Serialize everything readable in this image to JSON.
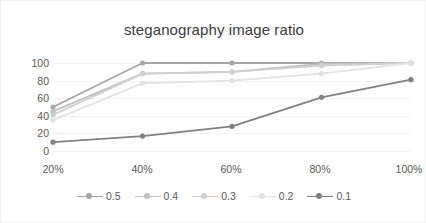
{
  "chart_data": {
    "type": "line",
    "title": "steganography image ratio",
    "xlabel": "",
    "ylabel": "",
    "categories": [
      "20%",
      "40%",
      "60%",
      "80%",
      "100%"
    ],
    "ylim": [
      0,
      100
    ],
    "yticks": [
      0,
      20,
      40,
      60,
      80,
      100
    ],
    "ytick_labels": [
      "0",
      "20",
      "40",
      "60",
      "80",
      "100"
    ],
    "grid": true,
    "legend_position": "bottom",
    "series": [
      {
        "name": "0.5",
        "color": "#a6a6a6",
        "values": [
          50,
          100,
          100,
          100,
          100
        ]
      },
      {
        "name": "0.4",
        "color": "#bfbfbf",
        "values": [
          45,
          88,
          90,
          99,
          100
        ]
      },
      {
        "name": "0.3",
        "color": "#cfcfcf",
        "values": [
          41,
          88,
          90,
          97,
          100
        ]
      },
      {
        "name": "0.2",
        "color": "#e2e2e2",
        "values": [
          35,
          77,
          80,
          88,
          100
        ]
      },
      {
        "name": "0.1",
        "color": "#808080",
        "values": [
          10,
          17,
          28,
          61,
          81
        ]
      }
    ]
  },
  "style": {
    "background": "#ffffff",
    "border_color": "#f0f0f0",
    "gridline_color": "#f2f2f2",
    "text_color": "#595959",
    "title_color": "#3b3b3b"
  }
}
